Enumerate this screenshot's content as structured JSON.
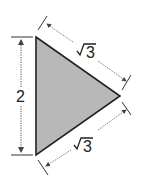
{
  "diagram": {
    "type": "triangle-with-dimensions",
    "fill_color": "#b8b8b8",
    "stroke_color": "#222222",
    "vertices": {
      "top": [
        36,
        37
      ],
      "right": [
        120,
        96
      ],
      "bottom": [
        36,
        155
      ]
    },
    "labels": {
      "left_side": "2",
      "upper_side_radical": "√",
      "upper_side_value": "3",
      "lower_side_radical": "√",
      "lower_side_value": "3"
    }
  }
}
